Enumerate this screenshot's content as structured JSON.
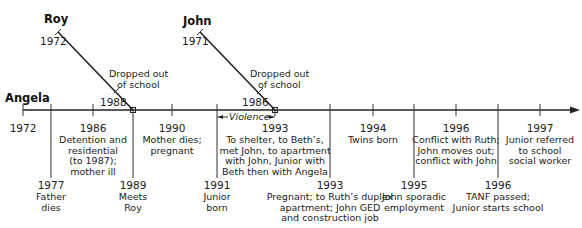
{
  "timeline": {
    "main_subject": "Angela",
    "colors": {
      "line": "#222222",
      "text": "#222222",
      "background": "#ffffff"
    },
    "branches": [
      {
        "name": "Roy",
        "start_year": "1972",
        "mid_year": "1988",
        "mid_label": [
          "Dropped out",
          "of school"
        ]
      },
      {
        "name": "John",
        "start_year": "1971",
        "mid_year": "1986",
        "mid_label": [
          "Dropped out",
          "of school"
        ]
      }
    ],
    "violence_label": "Violence",
    "events_above": [
      {
        "year": "1972",
        "lines": []
      },
      {
        "year": "1986",
        "lines": [
          "Detention and",
          "residential",
          "(to 1987);",
          "mother ill"
        ]
      },
      {
        "year": "1990",
        "lines": [
          "Mother dies;",
          "pregnant"
        ]
      },
      {
        "year": "1993",
        "lines": [
          "To shelter, to Beth’s,",
          "met John, to apartment",
          "with John, Junior with",
          "Beth then with Angela"
        ]
      },
      {
        "year": "1994",
        "lines": [
          "Twins born"
        ]
      },
      {
        "year": "1996",
        "lines": [
          "Conflict with Ruth;",
          "John moves out;",
          "conflict with John"
        ]
      },
      {
        "year": "1997",
        "lines": [
          "Junior referred",
          "to school",
          "social worker"
        ]
      }
    ],
    "events_below": [
      {
        "year": "1977",
        "lines": [
          "Father",
          "dies"
        ]
      },
      {
        "year": "1989",
        "lines": [
          "Meets",
          "Roy"
        ]
      },
      {
        "year": "1991",
        "lines": [
          "Junior",
          "born"
        ]
      },
      {
        "year": "1993",
        "lines": [
          "Pregnant; to Ruth’s duplex",
          "apartment; John GED",
          "and construction job"
        ]
      },
      {
        "year": "1995",
        "lines": [
          "John sporadic",
          "employment"
        ]
      },
      {
        "year": "1996",
        "lines": [
          "TANF passed;",
          "Junior starts school"
        ]
      }
    ]
  }
}
